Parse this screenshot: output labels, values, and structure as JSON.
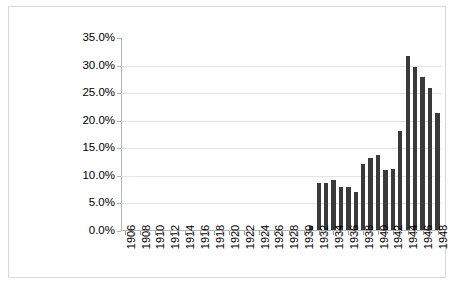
{
  "chart_data": {
    "type": "bar",
    "title": "",
    "subtitle": "",
    "xlabel": "",
    "ylabel": "",
    "ylim": [
      0,
      35
    ],
    "yticks": [
      "0.0%",
      "5.0%",
      "10.0%",
      "15.0%",
      "20.0%",
      "25.0%",
      "30.0%",
      "35.0%"
    ],
    "ytick_values": [
      0,
      5,
      10,
      15,
      20,
      25,
      30,
      35
    ],
    "grid": true,
    "legend": "none",
    "xtick_interval": 2,
    "categories": [
      "1906",
      "1907",
      "1908",
      "1909",
      "1910",
      "1911",
      "1912",
      "1913",
      "1914",
      "1915",
      "1916",
      "1917",
      "1918",
      "1919",
      "1920",
      "1921",
      "1922",
      "1923",
      "1924",
      "1925",
      "1926",
      "1927",
      "1928",
      "1929",
      "1930",
      "1931",
      "1932",
      "1933",
      "1934",
      "1935",
      "1936",
      "1937",
      "1938",
      "1939",
      "1940",
      "1941",
      "1942",
      "1943",
      "1944",
      "1945",
      "1946",
      "1947",
      "1948"
    ],
    "xtick_labels": [
      "1906",
      "",
      "1908",
      "",
      "1910",
      "",
      "1912",
      "",
      "1914",
      "",
      "1916",
      "",
      "1918",
      "",
      "1920",
      "",
      "1922",
      "",
      "1924",
      "",
      "1926",
      "",
      "1928",
      "",
      "1930",
      "",
      "1932",
      "",
      "1934",
      "",
      "1936",
      "",
      "1938",
      "",
      "1940",
      "",
      "1942",
      "",
      "1944",
      "",
      "1946",
      "",
      "1948"
    ],
    "values": [
      0,
      0,
      0,
      0,
      0,
      0,
      0,
      0,
      0,
      0,
      0,
      0,
      0,
      0,
      0,
      0,
      0,
      0,
      0,
      0,
      0,
      0,
      0,
      0,
      0,
      0.8,
      8.6,
      8.5,
      9.2,
      7.9,
      7.8,
      6.9,
      12.0,
      13.2,
      13.6,
      10.9,
      11.2,
      18.0,
      31.8,
      29.7,
      27.9,
      25.8,
      21.4
    ],
    "colors": {
      "bar": "#3a3a3a",
      "gridline": "#e4e4e4",
      "axis": "#b5b5b5",
      "border": "#d9d9d9",
      "text": "#000000",
      "background": "#ffffff"
    }
  }
}
